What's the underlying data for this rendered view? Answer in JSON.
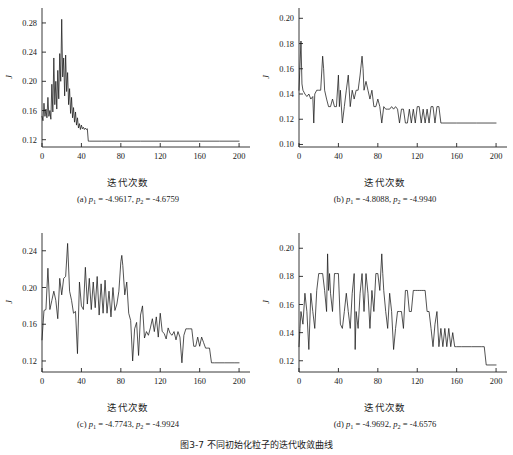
{
  "figure": {
    "caption": "图3-7  不同初始化粒子的迭代收敛曲线",
    "xlabel": "迭代次数",
    "ylabel": "J"
  },
  "chart_data": [
    {
      "type": "line",
      "panel": "a",
      "title": "(a) p1 = -4.9617, p2 = -4.6759",
      "caption_prefix": "(a) ",
      "p1": "-4.9617",
      "p2": "-4.6759",
      "xlabel": "迭代次数",
      "ylabel": "J",
      "xlim": [
        0,
        205
      ],
      "ylim": [
        0.11,
        0.295
      ],
      "xticks": [
        0,
        40,
        80,
        120,
        160,
        200
      ],
      "yticks": [
        0.12,
        0.16,
        0.2,
        0.24,
        0.28
      ],
      "ytick_labels": [
        "0.12",
        "0.16",
        "0.20",
        "0.24",
        "0.28"
      ],
      "grid": false,
      "legend": "none",
      "final_value": 0.118,
      "converged_at": 47,
      "x": [
        0,
        1,
        2,
        3,
        4,
        5,
        6,
        7,
        8,
        9,
        10,
        11,
        12,
        13,
        14,
        15,
        16,
        17,
        18,
        19,
        20,
        21,
        22,
        23,
        24,
        25,
        26,
        27,
        28,
        29,
        30,
        31,
        32,
        33,
        34,
        35,
        36,
        37,
        38,
        39,
        40,
        41,
        42,
        43,
        44,
        45,
        46,
        47,
        48,
        60,
        80,
        100,
        120,
        140,
        160,
        180,
        200
      ],
      "values": [
        0.152,
        0.146,
        0.17,
        0.152,
        0.162,
        0.15,
        0.178,
        0.152,
        0.16,
        0.148,
        0.196,
        0.158,
        0.232,
        0.168,
        0.2,
        0.162,
        0.215,
        0.176,
        0.238,
        0.2,
        0.285,
        0.206,
        0.232,
        0.18,
        0.236,
        0.186,
        0.212,
        0.168,
        0.19,
        0.156,
        0.178,
        0.15,
        0.164,
        0.144,
        0.158,
        0.14,
        0.15,
        0.136,
        0.142,
        0.134,
        0.14,
        0.135,
        0.137,
        0.134,
        0.136,
        0.134,
        0.135,
        0.118,
        0.118,
        0.118,
        0.118,
        0.118,
        0.118,
        0.118,
        0.118,
        0.118,
        0.118
      ]
    },
    {
      "type": "line",
      "panel": "b",
      "title": "(b) p1 = -4.8088, p2 = -4.9940",
      "caption_prefix": "(b) ",
      "p1": "-4.8088",
      "p2": "-4.9940",
      "xlabel": "迭代次数",
      "ylabel": "J",
      "xlim": [
        0,
        205
      ],
      "ylim": [
        0.098,
        0.205
      ],
      "xticks": [
        0,
        40,
        80,
        120,
        160,
        200
      ],
      "yticks": [
        0.1,
        0.12,
        0.14,
        0.16,
        0.18,
        0.2
      ],
      "ytick_labels": [
        "0.10",
        "0.12",
        "0.14",
        "0.16",
        "0.18",
        "0.20"
      ],
      "grid": false,
      "legend": "none",
      "final_value": 0.117,
      "converged_at": 145,
      "x": [
        0,
        2,
        3,
        4,
        6,
        8,
        10,
        12,
        14,
        15,
        16,
        18,
        20,
        22,
        24,
        25,
        26,
        28,
        30,
        32,
        34,
        36,
        38,
        40,
        41,
        42,
        44,
        46,
        48,
        50,
        52,
        54,
        56,
        58,
        60,
        62,
        64,
        65,
        66,
        68,
        70,
        72,
        74,
        76,
        78,
        80,
        82,
        84,
        86,
        88,
        90,
        92,
        94,
        96,
        98,
        100,
        102,
        104,
        106,
        108,
        110,
        112,
        114,
        116,
        118,
        120,
        122,
        124,
        126,
        128,
        130,
        132,
        134,
        136,
        138,
        140,
        142,
        144,
        146,
        160,
        180,
        200
      ],
      "values": [
        0.143,
        0.182,
        0.148,
        0.143,
        0.14,
        0.138,
        0.14,
        0.136,
        0.138,
        0.117,
        0.14,
        0.143,
        0.143,
        0.143,
        0.17,
        0.16,
        0.143,
        0.136,
        0.13,
        0.13,
        0.136,
        0.13,
        0.13,
        0.155,
        0.13,
        0.143,
        0.117,
        0.13,
        0.143,
        0.155,
        0.13,
        0.143,
        0.136,
        0.143,
        0.143,
        0.155,
        0.17,
        0.16,
        0.143,
        0.15,
        0.143,
        0.136,
        0.143,
        0.13,
        0.13,
        0.136,
        0.13,
        0.117,
        0.13,
        0.128,
        0.128,
        0.128,
        0.13,
        0.128,
        0.13,
        0.128,
        0.117,
        0.128,
        0.128,
        0.117,
        0.117,
        0.128,
        0.117,
        0.128,
        0.117,
        0.13,
        0.13,
        0.117,
        0.128,
        0.117,
        0.128,
        0.117,
        0.13,
        0.13,
        0.117,
        0.13,
        0.13,
        0.117,
        0.117,
        0.117,
        0.117,
        0.117
      ]
    },
    {
      "type": "line",
      "panel": "c",
      "title": "(c) p1 = -4.7743, p2 = -4.9924",
      "caption_prefix": "(c) ",
      "p1": "-4.7743",
      "p2": "-4.9924",
      "xlabel": "迭代次数",
      "ylabel": "J",
      "xlim": [
        0,
        205
      ],
      "ylim": [
        0.108,
        0.255
      ],
      "xticks": [
        0,
        40,
        80,
        120,
        160,
        200
      ],
      "yticks": [
        0.12,
        0.16,
        0.2,
        0.24
      ],
      "ytick_labels": [
        "0.12",
        "0.16",
        "0.20",
        "0.24"
      ],
      "grid": false,
      "legend": "none",
      "final_value": 0.118,
      "converged_at": 172,
      "x": [
        0,
        2,
        4,
        6,
        8,
        10,
        12,
        14,
        16,
        18,
        20,
        22,
        24,
        26,
        28,
        30,
        32,
        34,
        36,
        38,
        40,
        42,
        44,
        46,
        48,
        50,
        52,
        54,
        56,
        58,
        60,
        62,
        64,
        66,
        68,
        70,
        72,
        74,
        76,
        78,
        80,
        81,
        82,
        84,
        86,
        88,
        90,
        92,
        94,
        96,
        98,
        100,
        102,
        104,
        106,
        108,
        110,
        112,
        114,
        116,
        118,
        120,
        122,
        124,
        126,
        128,
        130,
        132,
        134,
        136,
        138,
        140,
        142,
        144,
        146,
        148,
        150,
        152,
        154,
        156,
        158,
        160,
        162,
        164,
        166,
        168,
        170,
        172,
        175,
        185,
        195,
        200
      ],
      "values": [
        0.143,
        0.175,
        0.176,
        0.221,
        0.176,
        0.186,
        0.196,
        0.186,
        0.166,
        0.21,
        0.192,
        0.21,
        0.212,
        0.248,
        0.196,
        0.186,
        0.172,
        0.174,
        0.128,
        0.206,
        0.18,
        0.176,
        0.222,
        0.182,
        0.21,
        0.176,
        0.206,
        0.178,
        0.212,
        0.17,
        0.204,
        0.172,
        0.208,
        0.172,
        0.196,
        0.168,
        0.2,
        0.175,
        0.182,
        0.196,
        0.228,
        0.235,
        0.224,
        0.192,
        0.206,
        0.172,
        0.164,
        0.12,
        0.155,
        0.162,
        0.126,
        0.17,
        0.18,
        0.145,
        0.152,
        0.148,
        0.156,
        0.166,
        0.152,
        0.168,
        0.146,
        0.172,
        0.152,
        0.15,
        0.144,
        0.156,
        0.15,
        0.148,
        0.152,
        0.143,
        0.152,
        0.146,
        0.118,
        0.148,
        0.155,
        0.155,
        0.155,
        0.155,
        0.136,
        0.136,
        0.146,
        0.136,
        0.146,
        0.14,
        0.134,
        0.134,
        0.134,
        0.118,
        0.118,
        0.118,
        0.118,
        0.118
      ]
    },
    {
      "type": "line",
      "panel": "d",
      "title": "(d) p1 = -4.9692, p2 = -4.6576",
      "caption_prefix": "(d) ",
      "p1": "-4.9692",
      "p2": "-4.6576",
      "xlabel": "迭代次数",
      "ylabel": "J",
      "xlim": [
        0,
        205
      ],
      "ylim": [
        0.112,
        0.208
      ],
      "xticks": [
        0,
        40,
        80,
        120,
        160,
        200
      ],
      "yticks": [
        0.12,
        0.14,
        0.16,
        0.18,
        0.2
      ],
      "ytick_labels": [
        "0.12",
        "0.14",
        "0.16",
        "0.18",
        "0.20"
      ],
      "grid": false,
      "legend": "none",
      "final_value": 0.117,
      "converged_at": 188,
      "x": [
        0,
        1,
        2,
        4,
        6,
        8,
        10,
        12,
        14,
        16,
        18,
        20,
        22,
        24,
        26,
        28,
        29,
        30,
        31,
        32,
        34,
        36,
        38,
        40,
        42,
        44,
        46,
        48,
        50,
        52,
        54,
        56,
        57,
        58,
        60,
        62,
        64,
        66,
        68,
        70,
        72,
        74,
        76,
        78,
        80,
        82,
        84,
        85,
        86,
        88,
        90,
        92,
        94,
        96,
        98,
        100,
        102,
        104,
        106,
        108,
        110,
        112,
        114,
        116,
        118,
        120,
        122,
        124,
        126,
        128,
        130,
        132,
        134,
        136,
        138,
        140,
        142,
        144,
        146,
        148,
        150,
        152,
        154,
        156,
        158,
        160,
        165,
        175,
        185,
        188,
        190,
        200
      ],
      "values": [
        0.13,
        0.143,
        0.155,
        0.146,
        0.168,
        0.155,
        0.128,
        0.168,
        0.155,
        0.143,
        0.17,
        0.182,
        0.182,
        0.182,
        0.17,
        0.155,
        0.196,
        0.17,
        0.182,
        0.168,
        0.155,
        0.182,
        0.182,
        0.182,
        0.146,
        0.143,
        0.155,
        0.168,
        0.155,
        0.143,
        0.168,
        0.182,
        0.128,
        0.155,
        0.143,
        0.168,
        0.182,
        0.155,
        0.182,
        0.168,
        0.143,
        0.17,
        0.155,
        0.182,
        0.182,
        0.17,
        0.196,
        0.182,
        0.17,
        0.155,
        0.143,
        0.168,
        0.155,
        0.128,
        0.143,
        0.155,
        0.155,
        0.155,
        0.143,
        0.17,
        0.17,
        0.155,
        0.155,
        0.17,
        0.17,
        0.17,
        0.17,
        0.17,
        0.17,
        0.17,
        0.155,
        0.155,
        0.143,
        0.13,
        0.146,
        0.155,
        0.13,
        0.143,
        0.13,
        0.143,
        0.13,
        0.143,
        0.13,
        0.14,
        0.13,
        0.13,
        0.13,
        0.13,
        0.13,
        0.13,
        0.117,
        0.117
      ]
    }
  ]
}
